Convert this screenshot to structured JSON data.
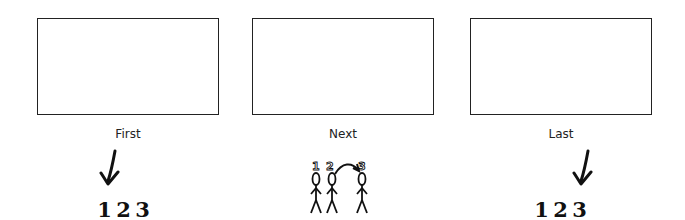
{
  "panels": [
    {
      "label": "First",
      "sequence": [
        "1",
        "2",
        "3"
      ],
      "highlight": "1"
    },
    {
      "label": "Next",
      "figures": [
        "1",
        "2",
        "3"
      ],
      "action": "2 moves toward 3"
    },
    {
      "label": "Last",
      "sequence": [
        "1",
        "2",
        "3"
      ],
      "highlight": "3"
    }
  ],
  "icons": {
    "first_arrow": "down-arrow-icon",
    "last_arrow": "down-arrow-icon",
    "next_figures": "stick-figures-icon"
  }
}
